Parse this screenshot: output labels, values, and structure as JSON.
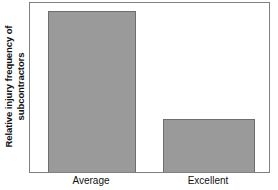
{
  "chart_data": {
    "type": "bar",
    "title": "",
    "subtitle": "",
    "xlabel": "",
    "ylabel_line1": "Relative injury frequency of",
    "ylabel_line2": "subcontractors",
    "ylabel": "Relative injury frequency of subcontractors",
    "categories": [
      "Average",
      "Excellent"
    ],
    "values": [
      100,
      33
    ],
    "ylim": [
      0,
      105
    ],
    "grid": false,
    "legend": null,
    "axis_ticks_visible": false,
    "bar_color": "#9a9a9a",
    "bar_edge_color": "#6e6e6e",
    "frame_color": "#808080",
    "background_color": "#ffffff",
    "text_color": "#111111",
    "series": [
      {
        "name": "Relative injury frequency of subcontractors",
        "values": [
          100,
          33
        ]
      }
    ]
  }
}
